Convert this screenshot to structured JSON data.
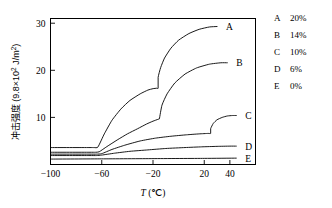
{
  "chart_data": {
    "type": "line",
    "title": "",
    "xlabel": "T (℃)",
    "ylabel": "冲击强度 (9.8×10² J/m²)",
    "ylabel_parts": {
      "name": "冲击强度",
      "open": " (9.8×10",
      "exp": "2",
      "close": " J/m",
      "exp2": "2",
      "tail": ")"
    },
    "xlabel_parts": {
      "symbol": "T",
      "unit": " (℃)"
    },
    "xlim": [
      -100,
      60
    ],
    "ylim": [
      0,
      31
    ],
    "xticks": [
      -100,
      -60,
      -20,
      20,
      40
    ],
    "xtick_labels": [
      "−100",
      "−60",
      "−20",
      "20",
      "40"
    ],
    "yticks": [
      10,
      20,
      30
    ],
    "ytick_labels": [
      "10",
      "20",
      "30"
    ],
    "grid": false,
    "legend_position": "right-outside",
    "series": [
      {
        "name": "A",
        "label": "A",
        "legend_value": "20%",
        "x": [
          -100,
          -70,
          -66,
          -63,
          -58,
          -52,
          -45,
          -38,
          -30,
          -24,
          -20,
          -17,
          -16,
          -16,
          -14,
          -11,
          -6,
          0,
          8,
          16,
          24,
          30
        ],
        "y": [
          3.6,
          3.6,
          3.6,
          3.7,
          6.5,
          9.4,
          11.8,
          13.6,
          15.0,
          15.8,
          16.1,
          16.2,
          16.2,
          18.5,
          20.6,
          22.6,
          24.7,
          26.4,
          27.8,
          28.7,
          29.2,
          29.3
        ]
      },
      {
        "name": "B",
        "label": "B",
        "legend_value": "14%",
        "x": [
          -100,
          -70,
          -65,
          -62,
          -56,
          -48,
          -40,
          -32,
          -25,
          -20,
          -16,
          -15,
          -15,
          -13,
          -9,
          -3,
          5,
          14,
          24,
          33,
          38
        ],
        "y": [
          2.6,
          2.6,
          2.6,
          2.7,
          3.8,
          5.2,
          6.5,
          7.6,
          8.6,
          9.2,
          9.6,
          9.7,
          9.7,
          12.6,
          15.0,
          17.3,
          19.2,
          20.5,
          21.3,
          21.6,
          21.6
        ]
      },
      {
        "name": "C",
        "label": "C",
        "legend_value": "10%",
        "x": [
          -100,
          -70,
          -64,
          -60,
          -52,
          -42,
          -30,
          -18,
          -6,
          6,
          16,
          23,
          25,
          25,
          27,
          30,
          34,
          38,
          42,
          45
        ],
        "y": [
          2.2,
          2.2,
          2.2,
          2.3,
          3.2,
          4.1,
          5.0,
          5.6,
          6.0,
          6.3,
          6.5,
          6.6,
          6.6,
          7.6,
          8.7,
          9.5,
          10.0,
          10.3,
          10.4,
          10.4
        ]
      },
      {
        "name": "D",
        "label": "D",
        "legend_value": "6%",
        "x": [
          -100,
          -70,
          -64,
          -60,
          -50,
          -38,
          -24,
          -10,
          5,
          18,
          30,
          40,
          45
        ],
        "y": [
          1.9,
          1.9,
          1.9,
          2.0,
          2.4,
          2.8,
          3.1,
          3.4,
          3.6,
          3.75,
          3.85,
          3.9,
          3.9
        ]
      },
      {
        "name": "E",
        "label": "E",
        "legend_value": "0%",
        "x": [
          -100,
          -60,
          -20,
          20,
          45
        ],
        "y": [
          1.15,
          1.2,
          1.25,
          1.3,
          1.35
        ]
      }
    ]
  },
  "legend": {
    "rows": [
      {
        "key": "A",
        "value": "20%"
      },
      {
        "key": "B",
        "value": "14%"
      },
      {
        "key": "C",
        "value": "10%"
      },
      {
        "key": "D",
        "value": "6%"
      },
      {
        "key": "E",
        "value": "0%"
      }
    ]
  }
}
